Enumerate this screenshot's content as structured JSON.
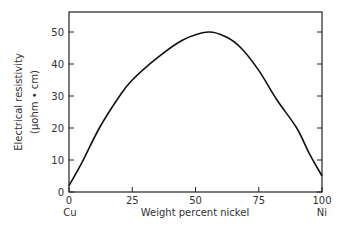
{
  "chart_data": {
    "type": "line",
    "title": "",
    "xlabel": "Weight percent nickel",
    "ylabel": "Electrical resistivity",
    "ylabel_units": "(μohm • cm)",
    "x_end_labels": {
      "left": "Cu",
      "right": "Ni"
    },
    "xlim": [
      0,
      100
    ],
    "ylim": [
      0,
      56
    ],
    "xticks": [
      "0",
      "25",
      "50",
      "75",
      "100"
    ],
    "yticks": [
      "0",
      "10",
      "20",
      "30",
      "40",
      "50"
    ],
    "grid": false,
    "series": [
      {
        "name": "Cu-Ni alloy resistivity",
        "x": [
          0,
          5,
          12,
          20,
          25,
          35,
          45,
          55,
          62,
          68,
          75,
          82,
          90,
          95,
          100
        ],
        "y": [
          2,
          9,
          20,
          30,
          35,
          42,
          47.5,
          50,
          48.5,
          45,
          38,
          29,
          20,
          12,
          5
        ]
      }
    ]
  }
}
